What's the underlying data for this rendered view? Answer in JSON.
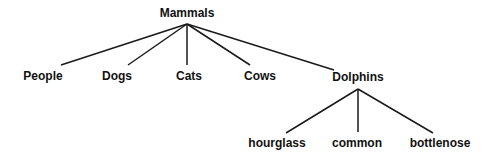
{
  "diagram": {
    "type": "tree",
    "root": {
      "label": "Mammals",
      "children": [
        {
          "label": "People"
        },
        {
          "label": "Dogs"
        },
        {
          "label": "Cats"
        },
        {
          "label": "Cows"
        },
        {
          "label": "Dolphins",
          "children": [
            {
              "label": "hourglass"
            },
            {
              "label": "common"
            },
            {
              "label": "bottlenose"
            }
          ]
        }
      ]
    }
  },
  "nodes": {
    "mammals": {
      "label": "Mammals",
      "x": 187,
      "y": 7
    },
    "people": {
      "label": "People",
      "x": 43,
      "y": 70
    },
    "dogs": {
      "label": "Dogs",
      "x": 117,
      "y": 70
    },
    "cats": {
      "label": "Cats",
      "x": 189,
      "y": 70
    },
    "cows": {
      "label": "Cows",
      "x": 260,
      "y": 70
    },
    "dolphins": {
      "label": "Dolphins",
      "x": 358,
      "y": 71
    },
    "hourglass": {
      "label": "hourglass",
      "x": 277,
      "y": 137
    },
    "common": {
      "label": "common",
      "x": 357,
      "y": 137
    },
    "bottlenose": {
      "label": "bottlenose",
      "x": 440,
      "y": 137
    }
  },
  "edges": [
    {
      "from": "mammals",
      "to": "people",
      "x1": 187,
      "y1": 24,
      "x2": 61,
      "y2": 65
    },
    {
      "from": "mammals",
      "to": "dogs",
      "x1": 187,
      "y1": 24,
      "x2": 128,
      "y2": 65
    },
    {
      "from": "mammals",
      "to": "cats",
      "x1": 187,
      "y1": 24,
      "x2": 187,
      "y2": 65
    },
    {
      "from": "mammals",
      "to": "cows",
      "x1": 187,
      "y1": 24,
      "x2": 250,
      "y2": 65
    },
    {
      "from": "mammals",
      "to": "dolphins",
      "x1": 187,
      "y1": 24,
      "x2": 334,
      "y2": 70
    },
    {
      "from": "dolphins",
      "to": "hourglass",
      "x1": 358,
      "y1": 89,
      "x2": 286,
      "y2": 133
    },
    {
      "from": "dolphins",
      "to": "common",
      "x1": 358,
      "y1": 89,
      "x2": 358,
      "y2": 132
    },
    {
      "from": "dolphins",
      "to": "bottlenose",
      "x1": 358,
      "y1": 89,
      "x2": 433,
      "y2": 133
    }
  ],
  "colors": {
    "line": "#1a1a1a",
    "text": "#111111",
    "background": "#ffffff"
  }
}
